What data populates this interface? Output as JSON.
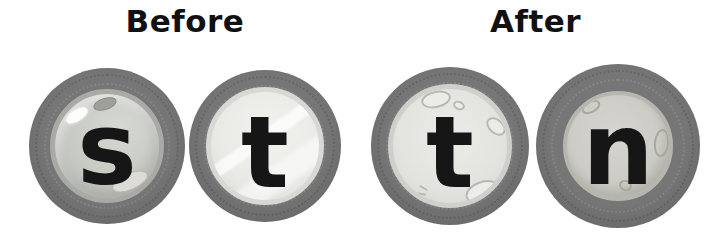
{
  "panels": [
    {
      "label": "Before",
      "tokens": [
        {
          "letter": "s"
        },
        {
          "letter": "t"
        }
      ]
    },
    {
      "label": "After",
      "tokens": [
        {
          "letter": "t"
        },
        {
          "letter": "n"
        }
      ]
    }
  ],
  "colors": {
    "background": "#ffffff",
    "heading_text": "#111111",
    "ring_gray": "#6b6b6b",
    "ring_edge": "#5d5d5d",
    "letter_black": "#161616",
    "disc_s": "#c7c9c3",
    "disc_t_before": "#e9e9e6",
    "disc_t_after": "#e3e3df",
    "disc_n": "#cccbc5"
  }
}
